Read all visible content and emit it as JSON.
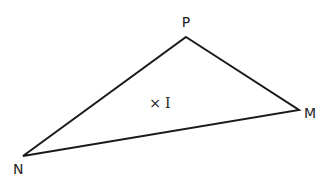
{
  "diagram": {
    "type": "triangle",
    "stroke_color": "#1a1a1a",
    "background": "#ffffff",
    "vertices": [
      {
        "name": "P",
        "x": 186,
        "y": 37,
        "label_x": 186,
        "label_y": 27
      },
      {
        "name": "M",
        "x": 299,
        "y": 110,
        "label_x": 304,
        "label_y": 118
      },
      {
        "name": "N",
        "x": 23,
        "y": 156,
        "label_x": 13,
        "label_y": 174
      }
    ],
    "points": [
      {
        "name": "I",
        "marker": "×",
        "x": 155,
        "y": 103,
        "label_x": 165,
        "label_y": 108
      }
    ]
  }
}
